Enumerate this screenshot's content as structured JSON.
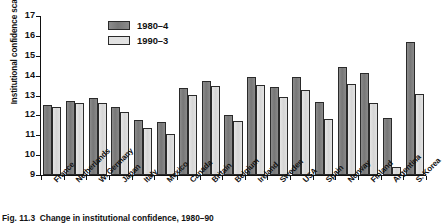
{
  "figure": {
    "caption_label": "Fig. 11.3",
    "caption_text": "Change in institutional confidence, 1980–90"
  },
  "axes": {
    "ylabel": "Institutional confidence scale",
    "yticks": [
      "9",
      "10",
      "11",
      "12",
      "13",
      "14",
      "15",
      "16",
      "17"
    ]
  },
  "legend": {
    "items": [
      {
        "label": "1980–4",
        "color": "#7e7e7e",
        "key": "s80"
      },
      {
        "label": "1990–3",
        "color": "#e2e2e2",
        "key": "s90"
      }
    ]
  },
  "chart_data": {
    "type": "bar",
    "title": "Change in institutional confidence, 1980–90",
    "xlabel": "",
    "ylabel": "Institutional confidence scale",
    "ylim": [
      9,
      17
    ],
    "grid": false,
    "legend_position": "top-center",
    "categories": [
      "France",
      "Netherlands",
      "W. Germany",
      "Japan",
      "Italy",
      "Mexico",
      "Canada",
      "Britain",
      "Belgium",
      "Ireland",
      "Sweden",
      "USA",
      "Spain",
      "Norway",
      "Finland",
      "Argentina",
      "S. Korea"
    ],
    "series": [
      {
        "name": "1980–4",
        "color": "#7e7e7e",
        "values": [
          12.5,
          12.7,
          12.85,
          12.4,
          11.75,
          11.65,
          13.4,
          13.75,
          12.0,
          13.95,
          13.45,
          13.95,
          12.65,
          14.45,
          14.15,
          11.85,
          15.7
        ]
      },
      {
        "name": "1990–3",
        "color": "#e2e2e2",
        "values": [
          12.4,
          12.6,
          12.6,
          12.15,
          11.35,
          11.05,
          13.05,
          13.5,
          11.7,
          13.55,
          12.95,
          13.3,
          11.8,
          13.6,
          12.6,
          9.4,
          13.1
        ]
      }
    ]
  }
}
